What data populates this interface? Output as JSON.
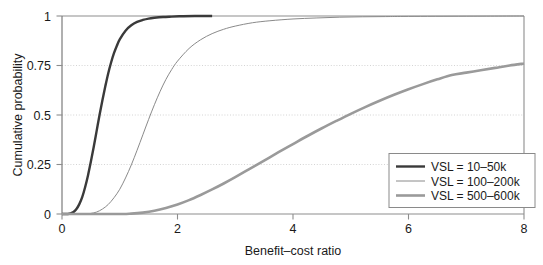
{
  "chart_data": {
    "type": "line",
    "title": "",
    "xlabel": "Benefit–cost ratio",
    "ylabel": "Cumulative probability",
    "xlim": [
      0,
      8
    ],
    "ylim": [
      0,
      1
    ],
    "grid": true,
    "grid_axis": "y",
    "legend_position": "lower-right",
    "xticks": [
      0,
      2,
      4,
      6,
      8
    ],
    "xtick_labels": [
      "0",
      "2",
      "4",
      "6",
      "8"
    ],
    "yticks": [
      0,
      0.25,
      0.5,
      0.75,
      1
    ],
    "ytick_labels": [
      "0",
      "0.25",
      "0.5",
      "0.75",
      "1"
    ],
    "series": [
      {
        "name": "VSL = 10–50k",
        "color": "#3a3a3a",
        "width": 2.4,
        "x": [
          0.0,
          0.1,
          0.15,
          0.2,
          0.25,
          0.3,
          0.35,
          0.4,
          0.45,
          0.5,
          0.55,
          0.6,
          0.65,
          0.7,
          0.75,
          0.8,
          0.85,
          0.9,
          0.95,
          1.0,
          1.1,
          1.2,
          1.3,
          1.4,
          1.5,
          1.6,
          1.75,
          1.9,
          2.1,
          2.3,
          2.6
        ],
        "y": [
          0.0,
          0.0,
          0.003,
          0.01,
          0.025,
          0.05,
          0.085,
          0.135,
          0.195,
          0.265,
          0.34,
          0.42,
          0.5,
          0.575,
          0.645,
          0.71,
          0.765,
          0.812,
          0.85,
          0.882,
          0.926,
          0.953,
          0.97,
          0.98,
          0.987,
          0.991,
          0.995,
          0.997,
          0.999,
          1.0,
          1.0
        ]
      },
      {
        "name": "VSL = 100–200k",
        "color": "#8a8a8a",
        "width": 1.0,
        "x": [
          0.0,
          0.4,
          0.5,
          0.6,
          0.7,
          0.8,
          0.9,
          1.0,
          1.1,
          1.2,
          1.3,
          1.4,
          1.5,
          1.6,
          1.7,
          1.8,
          1.9,
          2.0,
          2.2,
          2.4,
          2.6,
          2.8,
          3.0,
          3.3,
          3.6,
          4.0,
          4.4,
          4.8,
          5.2,
          5.6,
          6.0,
          7.0,
          8.0
        ],
        "y": [
          0.0,
          0.0,
          0.003,
          0.01,
          0.025,
          0.048,
          0.082,
          0.125,
          0.182,
          0.248,
          0.322,
          0.4,
          0.478,
          0.552,
          0.62,
          0.68,
          0.73,
          0.772,
          0.836,
          0.88,
          0.911,
          0.933,
          0.949,
          0.966,
          0.976,
          0.985,
          0.99,
          0.994,
          0.996,
          0.997,
          0.998,
          0.999,
          1.0
        ]
      },
      {
        "name": "VSL = 500–600k",
        "color": "#9a9a9a",
        "width": 2.6,
        "x": [
          0.0,
          1.0,
          1.2,
          1.4,
          1.6,
          1.8,
          2.0,
          2.2,
          2.4,
          2.6,
          2.8,
          3.0,
          3.25,
          3.5,
          3.75,
          4.0,
          4.25,
          4.5,
          4.75,
          5.0,
          5.25,
          5.5,
          5.75,
          6.0,
          6.25,
          6.5,
          6.75,
          7.0,
          7.25,
          7.5,
          7.75,
          8.0
        ],
        "y": [
          0.0,
          0.0,
          0.002,
          0.007,
          0.016,
          0.03,
          0.048,
          0.07,
          0.096,
          0.124,
          0.154,
          0.186,
          0.228,
          0.27,
          0.312,
          0.353,
          0.394,
          0.433,
          0.47,
          0.506,
          0.54,
          0.572,
          0.602,
          0.63,
          0.656,
          0.68,
          0.702,
          0.714,
          0.726,
          0.738,
          0.75,
          0.76
        ]
      }
    ]
  },
  "legend": {
    "entries": [
      {
        "label": "VSL = 10–50k"
      },
      {
        "label": "VSL = 100–200k"
      },
      {
        "label": "VSL = 500–600k"
      }
    ]
  }
}
